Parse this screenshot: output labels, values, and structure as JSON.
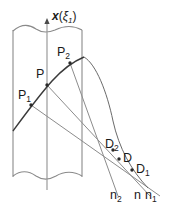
{
  "figure": {
    "title_label": "x(ξ₁)",
    "axis_label": {
      "var": "x",
      "open": "(",
      "xi": "ξ",
      "xi_sub": "1",
      "close": ")"
    },
    "stroke_colors": {
      "strip_edge": "#8a8a8a",
      "axis_line": "#9a9a9a",
      "wavefront_curve": "#3a3a3a",
      "ray": "#8c8c8c",
      "ray_dark": "#6a6a6a",
      "point_marker": "#2a2a2a",
      "label_text": "#1a1a1a",
      "background": "#ffffff"
    },
    "geometry": {
      "strip_left_x": 13,
      "strip_right_x": 82,
      "axis_x": 47,
      "strip_top_y": 28,
      "strip_bottom_y": 178
    },
    "points": [
      {
        "id": "P1",
        "base": "P",
        "sub": "1",
        "x": 31,
        "y": 105,
        "label_x": 18,
        "label_y": 89,
        "marker": true
      },
      {
        "id": "P",
        "base": "P",
        "sub": "",
        "x": 47,
        "y": 85,
        "label_x": 36,
        "label_y": 68,
        "marker": true
      },
      {
        "id": "P2",
        "base": "P",
        "sub": "2",
        "x": 70,
        "y": 63,
        "label_x": 57,
        "label_y": 46,
        "marker": true
      },
      {
        "id": "D2",
        "base": "D",
        "sub": "2",
        "x": 113,
        "y": 150,
        "label_x": 105,
        "label_y": 138,
        "marker": true
      },
      {
        "id": "D",
        "base": "D",
        "sub": "",
        "x": 119,
        "y": 159,
        "label_x": 122,
        "label_y": 152,
        "marker": true
      },
      {
        "id": "D1",
        "base": "D",
        "sub": "1",
        "x": 132,
        "y": 170,
        "label_x": 135,
        "label_y": 163,
        "marker": true
      }
    ],
    "normals": [
      {
        "id": "n2",
        "base": "n",
        "sub": "2",
        "label_x": 110,
        "label_y": 189
      },
      {
        "id": "n",
        "base": "n",
        "sub": "",
        "label_x": 134,
        "label_y": 189
      },
      {
        "id": "n1",
        "base": "n",
        "sub": "1",
        "label_x": 145,
        "label_y": 189
      }
    ],
    "curve_description": "wavefront arc rising from lower-left to upper-right",
    "ray_count": 3,
    "break_lines": [
      "top-wavy-break",
      "bottom-wavy-break"
    ]
  }
}
